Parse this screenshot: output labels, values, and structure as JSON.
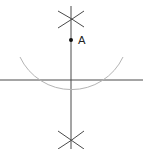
{
  "diagram": {
    "title": "",
    "type": "geometric-construction",
    "colors": {
      "line": "#4a4a4a",
      "arc": "#b4b4b4",
      "point": "#111111",
      "background": "#ffffff"
    },
    "points": [
      {
        "id": "A",
        "label": "A",
        "x": 71,
        "y": 40
      }
    ],
    "lines": [
      {
        "id": "horizontal-line",
        "x1": 0,
        "y1": 80,
        "x2": 143,
        "y2": 80
      },
      {
        "id": "perpendicular-line",
        "x1": 71,
        "y1": 6,
        "x2": 71,
        "y2": 149
      }
    ],
    "large_arc": {
      "center": "A",
      "cx": 71,
      "cy": 40,
      "r": 57,
      "start": [
        20,
        57
      ],
      "end": [
        123,
        57
      ]
    },
    "intersection_marks": [
      {
        "id": "top-cross",
        "x": 71,
        "y": 19
      },
      {
        "id": "bottom-cross",
        "x": 71,
        "y": 141
      }
    ],
    "arc_line_intersections": [
      {
        "x": 32,
        "y": 80
      },
      {
        "x": 110,
        "y": 80
      }
    ]
  }
}
